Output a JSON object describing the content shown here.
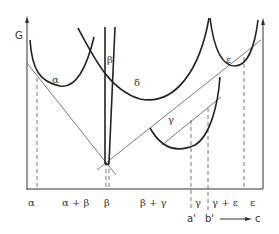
{
  "diagram": {
    "axis_label_y": "G",
    "phase_curves": {
      "alpha": "α",
      "beta": "β",
      "delta": "δ",
      "gamma": "γ",
      "epsilon": "ε"
    },
    "x_axis_regions": [
      "α",
      "α + β",
      "β",
      "β + γ",
      "γ",
      "γ + ε",
      "ε"
    ],
    "composition_markers": {
      "a_prime": "a'",
      "b_prime": "b'",
      "axis_label": "c"
    }
  }
}
